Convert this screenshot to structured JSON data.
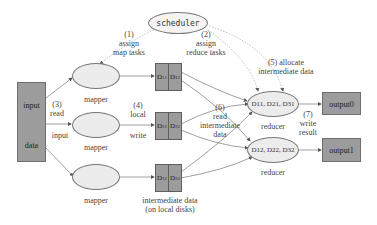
{
  "input": {
    "line1": "input",
    "line2": "data"
  },
  "scheduler": {
    "label": "scheduler"
  },
  "steps": {
    "s1": {
      "num": "(1)",
      "l1": "assign",
      "l2": "map tasks"
    },
    "s2": {
      "num": "(2)",
      "l1": "assign",
      "l2": "reduce tasks"
    },
    "s3": {
      "num": "(3)",
      "l1": "read",
      "l2": "input"
    },
    "s4": {
      "num": "(4)",
      "l1": "local",
      "l2": "write"
    },
    "s5": {
      "num": "(5) allocate",
      "l1": "intermediate data"
    },
    "s6": {
      "num": "(6)",
      "l1": "read",
      "l2": "intermediate",
      "l3": "data"
    },
    "s7": {
      "num": "(7)",
      "l1": "write",
      "l2": "result"
    }
  },
  "mappers": [
    {
      "label": "mapper",
      "partitions": [
        {
          "base": "D",
          "sub": "11"
        },
        {
          "base": "D",
          "sub": "12"
        }
      ]
    },
    {
      "label": "mapper",
      "partitions": [
        {
          "base": "D",
          "sub": "21"
        },
        {
          "base": "D",
          "sub": "22"
        }
      ]
    },
    {
      "label": "mapper",
      "partitions": [
        {
          "base": "D",
          "sub": "31"
        },
        {
          "base": "D",
          "sub": "32"
        }
      ]
    }
  ],
  "intermediate_caption": {
    "l1": "intermediate data",
    "l2": "(on local disks)"
  },
  "reducers": [
    {
      "label": "reducer",
      "inputs": "D11, D21, D31",
      "output": "output0"
    },
    {
      "label": "reducer",
      "inputs": "D12, D22, D32",
      "output": "output1"
    }
  ],
  "colors": {
    "box": "#9c9c9c",
    "ellipse": "#ececec",
    "line": "#777777"
  }
}
